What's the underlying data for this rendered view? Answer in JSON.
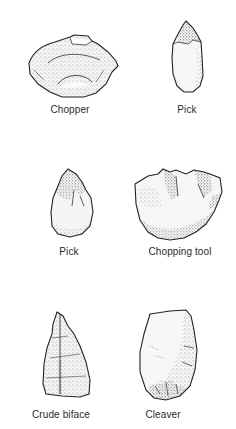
{
  "figure": {
    "background": "#ffffff",
    "ink_color": "#2a2a2a",
    "tools": [
      {
        "id": "chopper",
        "label": "Chopper"
      },
      {
        "id": "pick-1",
        "label": "Pick"
      },
      {
        "id": "pick-2",
        "label": "Pick"
      },
      {
        "id": "chopping-tool",
        "label": "Chopping tool"
      },
      {
        "id": "crude-biface",
        "label": "Crude biface"
      },
      {
        "id": "cleaver",
        "label": "Cleaver"
      }
    ]
  }
}
